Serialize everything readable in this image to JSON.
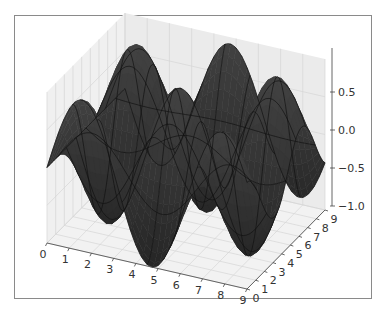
{
  "chart_data": {
    "type": "surface3d",
    "title": "",
    "function": "z = sin(x) * cos(y)",
    "xlabel": "",
    "ylabel": "",
    "zlabel": "",
    "x_ticks": [
      "0",
      "1",
      "2",
      "3",
      "4",
      "5",
      "6",
      "7",
      "8",
      "9"
    ],
    "y_ticks": [
      "0",
      "1",
      "2",
      "3",
      "4",
      "5",
      "6",
      "7",
      "8",
      "9"
    ],
    "z_ticks": [
      "-1.0",
      "-0.5",
      "0.0",
      "0.5"
    ],
    "xlim": [
      0,
      9
    ],
    "ylim": [
      0,
      9
    ],
    "zlim": [
      -1.0,
      1.0
    ],
    "grid": true,
    "legend": null,
    "surface_color": "#3a3a3a",
    "edge_color": "#111111",
    "pane_color": "#ececec",
    "grid_color": "#d6d6d6"
  },
  "figure": {
    "frame_border_color": "#8a8a8a",
    "background": "#ffffff"
  }
}
